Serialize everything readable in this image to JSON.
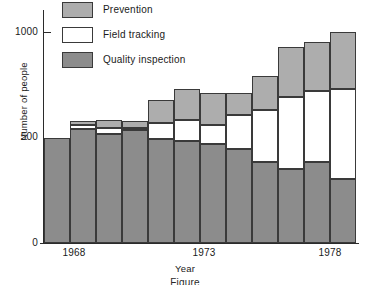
{
  "chart_data": {
    "type": "bar",
    "stacked": true,
    "title": "",
    "xlabel": "Year",
    "ylabel": "Number of people",
    "ylim": [
      0,
      1000
    ],
    "yticks": [
      0,
      500,
      1000
    ],
    "ytick_labels": [
      "0",
      "500",
      "1000"
    ],
    "grid": false,
    "legend_position": "top-left-inside",
    "categories": [
      1967,
      1968,
      1969,
      1970,
      1971,
      1972,
      1973,
      1974,
      1975,
      1976,
      1977,
      1978
    ],
    "xtick_values": [
      1968,
      1973,
      1978
    ],
    "xtick_labels": [
      "1968",
      "1973",
      "1978"
    ],
    "series": [
      {
        "name": "Quality inspection",
        "color": "#8c8c8c",
        "values": [
          500,
          540,
          515,
          535,
          495,
          485,
          470,
          445,
          385,
          350,
          385,
          305
        ]
      },
      {
        "name": "Field tracking",
        "color": "#ffffff",
        "values": [
          0,
          20,
          30,
          10,
          75,
          100,
          90,
          160,
          245,
          340,
          335,
          425
        ]
      },
      {
        "name": "Prevention",
        "color": "#adadad",
        "values": [
          0,
          20,
          40,
          35,
          110,
          145,
          150,
          105,
          160,
          240,
          235,
          270
        ]
      }
    ],
    "totals": [
      500,
      580,
      585,
      580,
      680,
      730,
      710,
      710,
      790,
      930,
      955,
      1000
    ]
  },
  "legend": {
    "entries": [
      {
        "label": "Prevention",
        "swatch": "prevention"
      },
      {
        "label": "Field tracking",
        "swatch": "field"
      },
      {
        "label": "Quality inspection",
        "swatch": "quality"
      }
    ]
  },
  "caption": {
    "text": "Figure"
  }
}
